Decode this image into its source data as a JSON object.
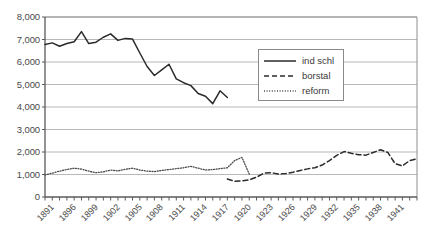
{
  "chart_data": {
    "type": "line",
    "title": "",
    "xlabel": "",
    "ylabel": "",
    "ylim": [
      0,
      8000
    ],
    "xlim": [
      1891,
      1942
    ],
    "grid": true,
    "legend_position": "upper-right",
    "ytick_labels": [
      "8,000",
      "7,000",
      "6,000",
      "5,000",
      "4,000",
      "3,000",
      "2,000",
      "1,000",
      "0"
    ],
    "ytick_values": [
      8000,
      7000,
      6000,
      5000,
      4000,
      3000,
      2000,
      1000,
      0
    ],
    "xtick_labels": [
      "1891",
      "1896",
      "1899",
      "1902",
      "1905",
      "1908",
      "1911",
      "1914",
      "1917",
      "1920",
      "1923",
      "1926",
      "1929",
      "1932",
      "1935",
      "1938",
      "1941"
    ],
    "xtick_values": [
      1891,
      1894,
      1897,
      1900,
      1903,
      1906,
      1909,
      1912,
      1915,
      1918,
      1921,
      1924,
      1927,
      1930,
      1933,
      1936,
      1939
    ],
    "series": [
      {
        "name": "ind schl",
        "style": "solid",
        "color": "#2b2b2b",
        "x": [
          1891,
          1892,
          1893,
          1894,
          1895,
          1896,
          1897,
          1898,
          1899,
          1900,
          1901,
          1902,
          1903,
          1904,
          1905,
          1906,
          1907,
          1908,
          1909,
          1910,
          1911,
          1912,
          1913,
          1914,
          1915,
          1916
        ],
        "values": [
          6780,
          6850,
          6700,
          6820,
          6900,
          7350,
          6820,
          6880,
          7100,
          7250,
          6960,
          7050,
          7020,
          6400,
          5800,
          5400,
          5650,
          5900,
          5250,
          5080,
          4950,
          4600,
          4480,
          4150,
          4720,
          4420
        ]
      },
      {
        "name": "borstal",
        "style": "dashed",
        "color": "#2b2b2b",
        "x": [
          1916,
          1917,
          1918,
          1919,
          1920,
          1921,
          1922,
          1923,
          1924,
          1925,
          1926,
          1927,
          1928,
          1929,
          1930,
          1931,
          1932,
          1933,
          1934,
          1935,
          1936,
          1937,
          1938,
          1939,
          1940,
          1941,
          1942
        ],
        "values": [
          800,
          700,
          720,
          760,
          880,
          1060,
          1080,
          1020,
          1040,
          1100,
          1180,
          1250,
          1300,
          1420,
          1620,
          1850,
          2020,
          1940,
          1880,
          1860,
          1980,
          2100,
          1980,
          1480,
          1380,
          1620,
          1700
        ]
      },
      {
        "name": "reform",
        "style": "dotted",
        "color": "#4a4a4a",
        "x": [
          1891,
          1892,
          1893,
          1894,
          1895,
          1896,
          1897,
          1898,
          1899,
          1900,
          1901,
          1902,
          1903,
          1904,
          1905,
          1906,
          1907,
          1908,
          1909,
          1910,
          1911,
          1912,
          1913,
          1914,
          1915,
          1916,
          1917,
          1918,
          1919
        ],
        "values": [
          980,
          1060,
          1150,
          1220,
          1280,
          1240,
          1150,
          1080,
          1120,
          1200,
          1160,
          1230,
          1280,
          1200,
          1150,
          1130,
          1180,
          1220,
          1260,
          1300,
          1360,
          1280,
          1200,
          1220,
          1260,
          1300,
          1620,
          1760,
          1020
        ]
      }
    ]
  },
  "legend": {
    "items": [
      {
        "label": "ind schl",
        "style": "solid"
      },
      {
        "label": "borstal",
        "style": "dashed"
      },
      {
        "label": "reform",
        "style": "dotted"
      }
    ]
  }
}
